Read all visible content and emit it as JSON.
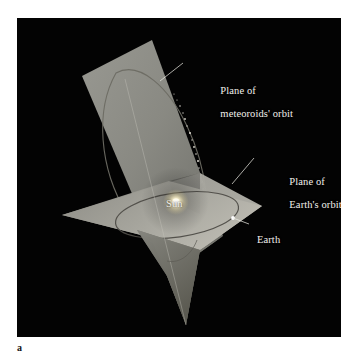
{
  "figure": {
    "caption_letter": "a",
    "panel_background": "#030303",
    "page_background": "#ffffff",
    "label_color": "#f2f0ec"
  },
  "labels": {
    "meteoroid_plane_line1": "Plane of",
    "meteoroid_plane_line2": "meteoroids' orbit",
    "earth_plane_line1": "Plane of",
    "earth_plane_line2": "Earth's orbit",
    "sun": "Sun",
    "earth": "Earth"
  },
  "diagram": {
    "type": "3d-orbital-plane-illustration",
    "planes": [
      {
        "name": "plane-of-earths-orbit",
        "description": "Shallow quadrilateral representing the ecliptic plane",
        "fill": "#9a9a94",
        "orientation": "near-horizontal"
      },
      {
        "name": "plane-of-meteoroids-orbit",
        "description": "Steeply inclined quadrilateral crossing the ecliptic",
        "fill": "#8e8e88",
        "orientation": "steeply-tilted"
      }
    ],
    "orbits": [
      {
        "name": "earths-orbit",
        "stroke": "#55534e",
        "shape": "ellipse-in-ecliptic-plane"
      },
      {
        "name": "meteoroids-orbit",
        "stroke": "#6a6862",
        "shape": "elongated-ellipse-in-tilted-plane"
      }
    ],
    "bodies": [
      {
        "name": "sun",
        "description": "Bright glowing point at the common focus",
        "color": "#fffbe8"
      },
      {
        "name": "earth",
        "description": "Small white dot on Earth's orbit",
        "color": "#ffffff"
      },
      {
        "name": "meteoroid-stream",
        "description": "Chain of small bright particles strung along the meteoroid orbit",
        "color": "#e8e6dd"
      }
    ],
    "leader_lines": [
      {
        "name": "leader-meteoroid-plane"
      },
      {
        "name": "leader-earth-plane"
      },
      {
        "name": "leader-earth"
      }
    ]
  }
}
